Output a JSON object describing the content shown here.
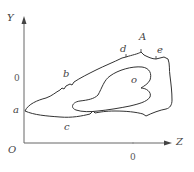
{
  "diagram": {
    "axes": {
      "y_label": "Y",
      "z_label": "Z",
      "origin_label": "O",
      "y_tick_label": "0",
      "z_tick_label": "0"
    },
    "points": {
      "a": "a",
      "b": "b",
      "c": "c",
      "d": "d",
      "A": "A",
      "e": "e",
      "o": "o"
    },
    "colors": {
      "line": "#333333",
      "axis": "#666666"
    }
  }
}
